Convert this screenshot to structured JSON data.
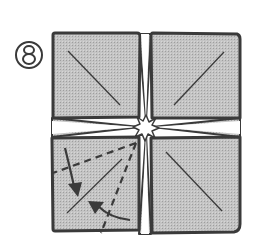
{
  "diagram": {
    "type": "origami-folding-step",
    "step_number": "8",
    "step_label": "⑧",
    "colors": {
      "paper_fill": "#bdbdbd",
      "outline": "#3a3a3a",
      "background": "#ffffff",
      "center_opening": "#ffffff"
    },
    "elements": [
      {
        "id": "square-top-left",
        "kind": "folded-square-flap",
        "crease": "diagonal top-left to bottom-right"
      },
      {
        "id": "square-top-right",
        "kind": "folded-square-flap",
        "crease": "diagonal bottom-left to top-right"
      },
      {
        "id": "square-bottom-left",
        "kind": "folded-square-flap",
        "crease": "diagonal bottom-left to top-right",
        "fold_lines": "two dashed valley folds radiating from center",
        "arrows": "two curved arrows showing flap edges folding inward"
      },
      {
        "id": "square-bottom-right",
        "kind": "folded-square-flap",
        "crease": "diagonal top-left to bottom-right"
      },
      {
        "id": "center-opening",
        "kind": "star-shaped opening where four flaps meet"
      }
    ]
  }
}
